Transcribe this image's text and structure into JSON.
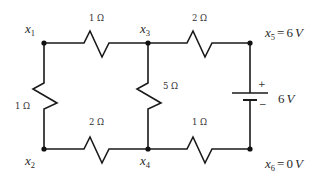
{
  "diagram": {
    "type": "electrical-circuit",
    "nodes": [
      {
        "id": "x1",
        "var": "x",
        "sub": "1"
      },
      {
        "id": "x2",
        "var": "x",
        "sub": "2"
      },
      {
        "id": "x3",
        "var": "x",
        "sub": "3"
      },
      {
        "id": "x4",
        "var": "x",
        "sub": "4"
      },
      {
        "id": "x5",
        "var": "x",
        "sub": "5",
        "eq": "=",
        "value": "6",
        "unit": "V"
      },
      {
        "id": "x6",
        "var": "x",
        "sub": "6",
        "eq": "=",
        "value": "0",
        "unit": "V"
      }
    ],
    "resistors": [
      {
        "id": "r13",
        "between": [
          "x1",
          "x3"
        ],
        "label": "1 Ω"
      },
      {
        "id": "r35",
        "between": [
          "x3",
          "x5"
        ],
        "label": "2 Ω"
      },
      {
        "id": "r12",
        "between": [
          "x1",
          "x2"
        ],
        "label": "1 Ω"
      },
      {
        "id": "r34",
        "between": [
          "x3",
          "x4"
        ],
        "label": "5 Ω"
      },
      {
        "id": "r24",
        "between": [
          "x2",
          "x4"
        ],
        "label": "2 Ω"
      },
      {
        "id": "r46",
        "between": [
          "x4",
          "x6"
        ],
        "label": "1 Ω"
      }
    ],
    "battery": {
      "between": [
        "x5",
        "x6"
      ],
      "plus": "+",
      "minus": "−",
      "value": "6",
      "unit": "V"
    }
  }
}
